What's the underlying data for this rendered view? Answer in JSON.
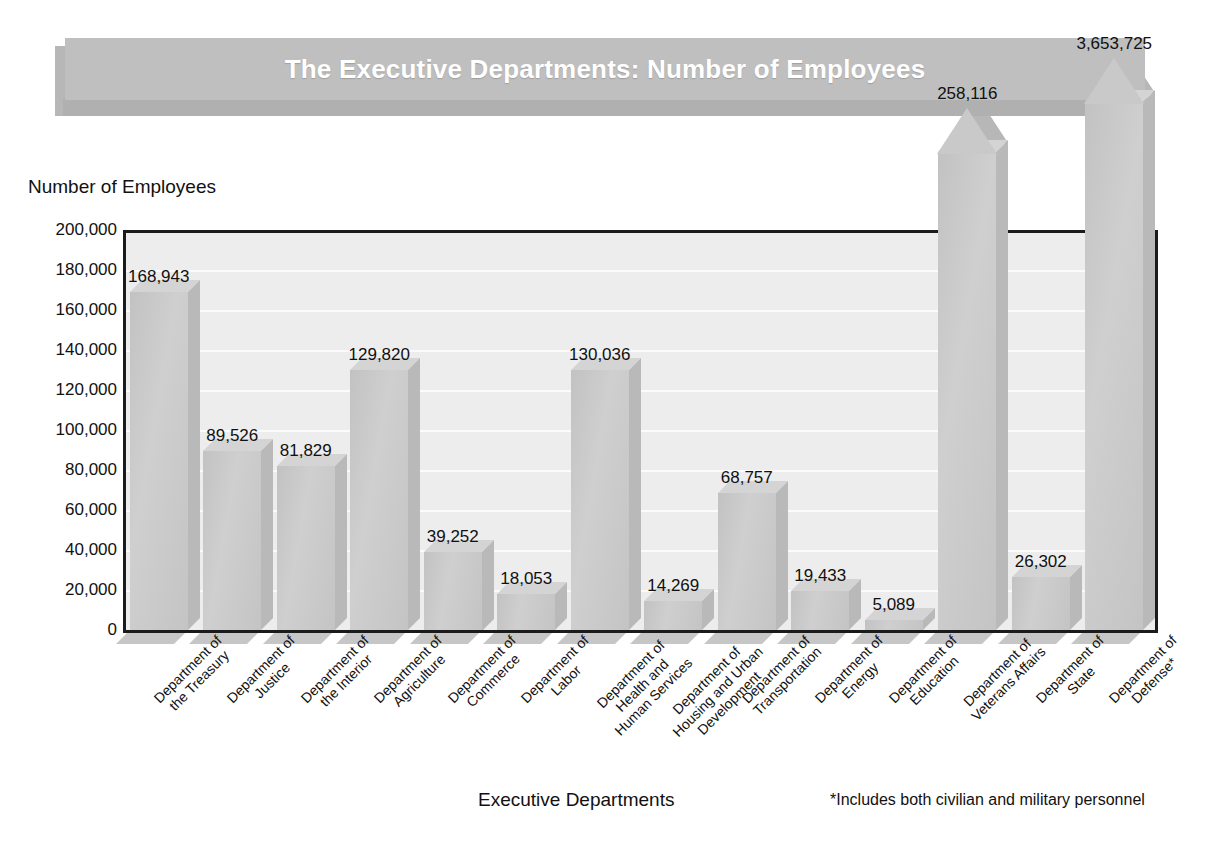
{
  "title": "The Executive Departments: Number of Employees",
  "axes": {
    "y_title": "Number of Employees",
    "x_title": "Executive Departments",
    "footnote": "*Includes both civilian and military personnel"
  },
  "yticks": [
    "200,000",
    "180,000",
    "160,000",
    "140,000",
    "120,000",
    "100,000",
    "80,000",
    "60,000",
    "40,000",
    "20,000",
    "0"
  ],
  "chart_data": {
    "type": "bar",
    "title": "The Executive Departments: Number of Employees",
    "xlabel": "Executive Departments",
    "ylabel": "Number of Employees",
    "ylim": [
      0,
      200000
    ],
    "ytick_step": 20000,
    "grid": true,
    "legend": null,
    "annotations": [
      "*Includes both civilian and military personnel"
    ],
    "note": "Veterans Affairs and Defense bars are drawn as arrows that break above the 200,000 axis maximum.",
    "categories": [
      "Department of the Treasury",
      "Department of Justice",
      "Department of the Interior",
      "Department of Agriculture",
      "Department of Commerce",
      "Department of Labor",
      "Department of Health and Human Services",
      "Department of Housing and Urban Development",
      "Department of Transportation",
      "Department of Energy",
      "Department of Education",
      "Department of Veterans Affairs",
      "Department of State",
      "Department of Defense*"
    ],
    "values": [
      168943,
      89526,
      81829,
      129820,
      39252,
      18053,
      130036,
      14269,
      68757,
      19433,
      5089,
      258116,
      26302,
      3653725
    ],
    "value_labels": [
      "168,943",
      "89,526",
      "81,829",
      "129,820",
      "39,252",
      "18,053",
      "130,036",
      "14,269",
      "68,757",
      "19,433",
      "5,089",
      "258,116",
      "26,302",
      "3,653,725"
    ]
  },
  "bars": [
    {
      "label_lines": [
        "Department of",
        "the Treasury"
      ],
      "value_label": "168,943",
      "value": 168943,
      "overflow": false
    },
    {
      "label_lines": [
        "Department of",
        "Justice"
      ],
      "value_label": "89,526",
      "value": 89526,
      "overflow": false
    },
    {
      "label_lines": [
        "Department of",
        "the Interior"
      ],
      "value_label": "81,829",
      "value": 81829,
      "overflow": false
    },
    {
      "label_lines": [
        "Department of",
        "Agriculture"
      ],
      "value_label": "129,820",
      "value": 129820,
      "overflow": false
    },
    {
      "label_lines": [
        "Department of",
        "Commerce"
      ],
      "value_label": "39,252",
      "value": 39252,
      "overflow": false
    },
    {
      "label_lines": [
        "Department of",
        "Labor"
      ],
      "value_label": "18,053",
      "value": 18053,
      "overflow": false
    },
    {
      "label_lines": [
        "Department of",
        "Health and",
        "Human Services"
      ],
      "value_label": "130,036",
      "value": 130036,
      "overflow": false
    },
    {
      "label_lines": [
        "Department of",
        "Housing and Urban",
        "Development"
      ],
      "value_label": "14,269",
      "value": 14269,
      "overflow": false
    },
    {
      "label_lines": [
        "Department of",
        "Transportation"
      ],
      "value_label": "68,757",
      "value": 68757,
      "overflow": false
    },
    {
      "label_lines": [
        "Department of",
        "Energy"
      ],
      "value_label": "19,433",
      "value": 19433,
      "overflow": false
    },
    {
      "label_lines": [
        "Department of",
        "Education"
      ],
      "value_label": "5,089",
      "value": 5089,
      "overflow": false
    },
    {
      "label_lines": [
        "Department of",
        "Veterans Affairs"
      ],
      "value_label": "258,116",
      "value": 258116,
      "overflow": true
    },
    {
      "label_lines": [
        "Department of",
        "State"
      ],
      "value_label": "26,302",
      "value": 26302,
      "overflow": false
    },
    {
      "label_lines": [
        "Department of",
        "Defense*"
      ],
      "value_label": "3,653,725",
      "value": 3653725,
      "overflow": true
    }
  ],
  "colors": {
    "title_band": "#bfbfbf",
    "title_text": "#ffffff",
    "plot_bg": "#ededed",
    "bar_face": "#c9c9c9",
    "axis": "#1b1b1b",
    "text": "#111111"
  }
}
